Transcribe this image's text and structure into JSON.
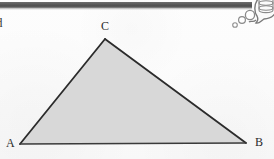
{
  "page": {
    "background_color": "#fdfdfd",
    "width": 274,
    "height": 159,
    "margin_glyph": "d"
  },
  "scan_bar": {
    "name": "scan-edge-bar",
    "color": "#575757",
    "highlight_color": "#8c8c8c"
  },
  "figure": {
    "type": "triangle",
    "caption": "",
    "fill_color": "#d8d8d8",
    "stroke_color": "#2b2b2b",
    "baseline_color": "#3a3a3a",
    "vertices": [
      {
        "id": "A",
        "label": "A",
        "x": 20,
        "y": 144
      },
      {
        "id": "B",
        "label": "B",
        "x": 246,
        "y": 143
      },
      {
        "id": "C",
        "label": "C",
        "x": 105,
        "y": 39
      }
    ],
    "edges": [
      {
        "id": "AC",
        "from": "A",
        "to": "C"
      },
      {
        "id": "CB",
        "from": "C",
        "to": "B"
      },
      {
        "id": "AB",
        "from": "A",
        "to": "B"
      }
    ]
  },
  "thought_bubble": {
    "name": "thought-bubble",
    "stroke_color": "#7a7a7a",
    "fill_color": "#fbfbfb",
    "inner_shape": "cylinder-stack",
    "trailing_circles": [
      {
        "cx": 250,
        "cy": 15,
        "r": 4.6
      },
      {
        "cx": 243,
        "cy": 20,
        "r": 3.4
      },
      {
        "cx": 236,
        "cy": 25,
        "r": 2.2
      }
    ]
  }
}
